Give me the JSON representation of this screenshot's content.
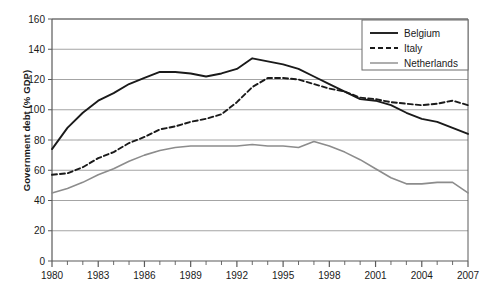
{
  "chart_data": {
    "type": "line",
    "title": "",
    "xlabel": "",
    "ylabel": "Government debt (% GDP)",
    "xlim": [
      1980,
      2007
    ],
    "ylim": [
      0,
      160
    ],
    "ytick_step": 20,
    "yticks": [
      "0",
      "20",
      "40",
      "60",
      "80",
      "100",
      "120",
      "140",
      "160"
    ],
    "xticks": [
      "1980",
      "1983",
      "1986",
      "1989",
      "1992",
      "1995",
      "1998",
      "2001",
      "2004",
      "2007"
    ],
    "xtick_step": 3,
    "minor_xticks_every_year": true,
    "grid": "horizontal",
    "legend_position": "top-right",
    "x": [
      1980,
      1981,
      1982,
      1983,
      1984,
      1985,
      1986,
      1987,
      1988,
      1989,
      1990,
      1991,
      1992,
      1993,
      1994,
      1995,
      1996,
      1997,
      1998,
      1999,
      2000,
      2001,
      2002,
      2003,
      2004,
      2005,
      2006,
      2007
    ],
    "series": [
      {
        "name": "Belgium",
        "color": "#1a1a1a",
        "style": "solid",
        "width": 1.9,
        "values": [
          74,
          88,
          98,
          106,
          111,
          117,
          121,
          125,
          125,
          124,
          122,
          124,
          127,
          134,
          132,
          130,
          127,
          122,
          117,
          112,
          107,
          106,
          103,
          98,
          94,
          92,
          88,
          84
        ]
      },
      {
        "name": "Italy",
        "color": "#1a1a1a",
        "style": "dashed",
        "width": 1.9,
        "values": [
          57,
          58,
          62,
          68,
          72,
          78,
          82,
          87,
          89,
          92,
          94,
          97,
          105,
          115,
          121,
          121,
          120,
          117,
          114,
          112,
          108,
          107,
          105,
          104,
          103,
          104,
          106,
          103
        ]
      },
      {
        "name": "Netherlands",
        "color": "#8c8c8c",
        "style": "solid",
        "width": 1.6,
        "values": [
          45,
          48,
          52,
          57,
          61,
          66,
          70,
          73,
          75,
          76,
          76,
          76,
          76,
          77,
          76,
          76,
          75,
          79,
          76,
          72,
          67,
          61,
          55,
          51,
          51,
          52,
          52,
          45
        ]
      }
    ],
    "legend": [
      {
        "label": "Belgium",
        "color": "#1a1a1a",
        "style": "solid"
      },
      {
        "label": "Italy",
        "color": "#1a1a1a",
        "style": "dashed"
      },
      {
        "label": "Netherlands",
        "color": "#8c8c8c",
        "style": "solid"
      }
    ],
    "colors": {
      "axis": "#5a5a5a",
      "grid": "#9a9a9a",
      "text": "#1a1a1a",
      "legend_border": "#6b6b6b",
      "background": "#ffffff"
    }
  }
}
